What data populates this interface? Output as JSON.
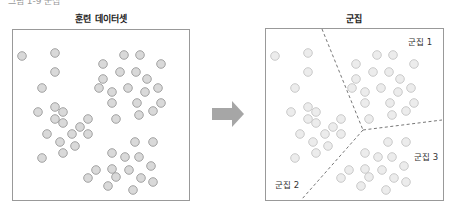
{
  "header_fragment": "그림 1-9 군집",
  "left_panel": {
    "title": "훈련 데이터셋"
  },
  "right_panel": {
    "title": "군집",
    "labels": [
      "군집 1",
      "군집 2",
      "군집 3"
    ]
  },
  "colors": {
    "point_fill": "#d9d9d9",
    "point_stroke": "#9a9a9a",
    "arrow": "#a6a6a6",
    "border": "#999999",
    "divider": "#777777"
  },
  "points": [
    [
      22,
      56
    ],
    [
      55,
      53
    ],
    [
      55,
      72
    ],
    [
      42,
      88
    ],
    [
      38,
      112
    ],
    [
      55,
      107
    ],
    [
      63,
      112
    ],
    [
      55,
      119
    ],
    [
      63,
      123
    ],
    [
      88,
      119
    ],
    [
      80,
      127
    ],
    [
      47,
      134
    ],
    [
      72,
      134
    ],
    [
      88,
      134
    ],
    [
      60,
      142
    ],
    [
      75,
      146
    ],
    [
      42,
      158
    ],
    [
      63,
      153
    ],
    [
      124,
      55
    ],
    [
      140,
      55
    ],
    [
      103,
      64
    ],
    [
      120,
      72
    ],
    [
      136,
      72
    ],
    [
      103,
      79
    ],
    [
      99,
      88
    ],
    [
      112,
      92
    ],
    [
      128,
      88
    ],
    [
      145,
      92
    ],
    [
      158,
      88
    ],
    [
      147,
      79
    ],
    [
      161,
      64
    ],
    [
      112,
      103
    ],
    [
      137,
      103
    ],
    [
      161,
      103
    ],
    [
      139,
      115
    ],
    [
      153,
      111
    ],
    [
      116,
      119
    ],
    [
      135,
      142
    ],
    [
      153,
      142
    ],
    [
      112,
      153
    ],
    [
      125,
      157
    ],
    [
      139,
      157
    ],
    [
      151,
      166
    ],
    [
      96,
      170
    ],
    [
      112,
      169
    ],
    [
      129,
      170
    ],
    [
      88,
      178
    ],
    [
      116,
      177
    ],
    [
      141,
      178
    ],
    [
      153,
      182
    ],
    [
      108,
      186
    ],
    [
      133,
      190
    ]
  ]
}
